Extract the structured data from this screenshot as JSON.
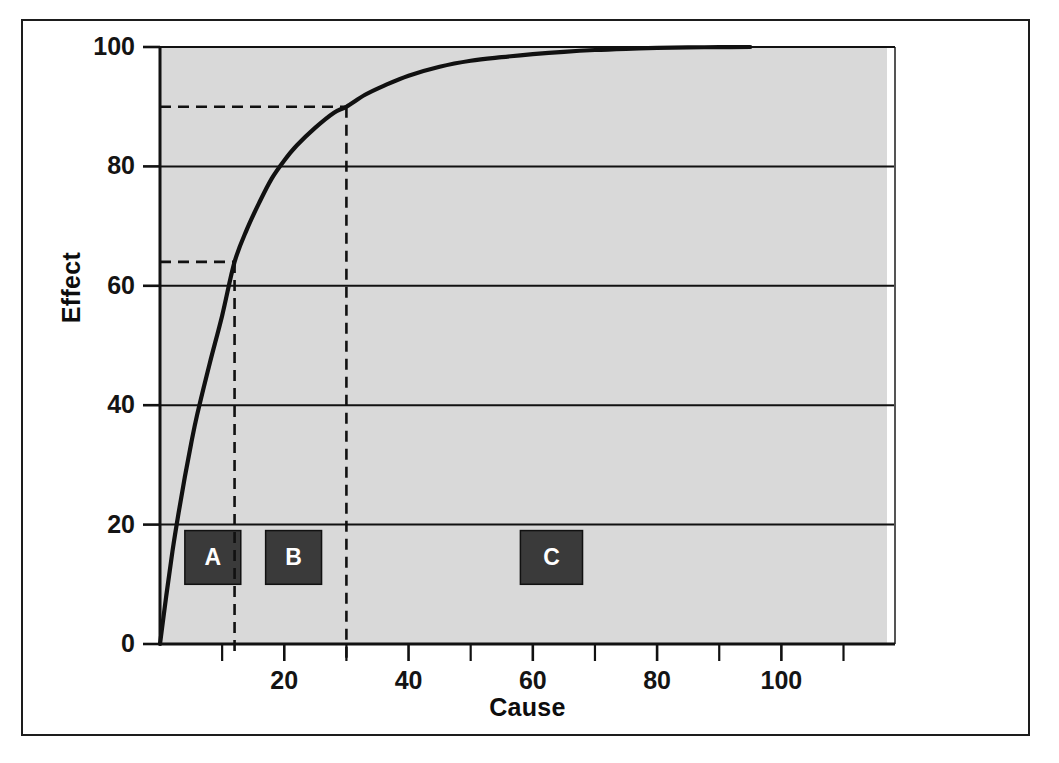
{
  "figure": {
    "caption_fragment": "",
    "background_color": "#ffffff",
    "frame_color": "#1d1d1d"
  },
  "chart_data": {
    "type": "line",
    "title": "",
    "subtitle": "",
    "xlabel": "Cause",
    "ylabel": "Effect",
    "xlim": [
      0,
      117
    ],
    "ylim": [
      0,
      100
    ],
    "grid": true,
    "grid_axis": "y",
    "legend": "none",
    "plot_background_color": "#d9d9d9",
    "curve_color": "#111111",
    "x_ticks": [
      20,
      40,
      60,
      80,
      100
    ],
    "x_tick_labels": [
      "20",
      "40",
      "60",
      "80",
      "100"
    ],
    "y_ticks": [
      0,
      20,
      40,
      60,
      80,
      100
    ],
    "y_tick_labels": [
      "0",
      "20",
      "40",
      "60",
      "80",
      "100"
    ],
    "series": [
      {
        "name": "Cumulative effect",
        "x": [
          0,
          1,
          2,
          3,
          4,
          5,
          6,
          8,
          10,
          12,
          14,
          16,
          18,
          20,
          22,
          25,
          28,
          30,
          33,
          36,
          40,
          45,
          50,
          55,
          60,
          65,
          70,
          75,
          80,
          85,
          90,
          95
        ],
        "y": [
          0,
          8,
          15.5,
          22,
          28,
          33.5,
          38.5,
          47,
          55,
          64,
          69.5,
          74,
          78,
          81,
          83.5,
          86.5,
          89,
          90,
          92,
          93.5,
          95.2,
          96.7,
          97.7,
          98.3,
          98.8,
          99.2,
          99.5,
          99.7,
          99.85,
          99.93,
          99.98,
          100
        ]
      }
    ],
    "annotations": [
      {
        "name": "reference-marker-1",
        "type": "dashed-crosshair",
        "x": 12,
        "y": 64,
        "label": ""
      },
      {
        "name": "reference-marker-2",
        "type": "dashed-crosshair",
        "x": 30,
        "y": 90,
        "label": ""
      }
    ],
    "zones": [
      {
        "label": "A",
        "x_start": 4,
        "x_end": 13,
        "y_start": 10,
        "y_end": 19,
        "color": "#3a3a3a",
        "text_color": "#ffffff"
      },
      {
        "label": "B",
        "x_start": 17,
        "x_end": 26,
        "y_start": 10,
        "y_end": 19,
        "color": "#3a3a3a",
        "text_color": "#ffffff"
      },
      {
        "label": "C",
        "x_start": 58,
        "x_end": 68,
        "y_start": 10,
        "y_end": 19,
        "color": "#3a3a3a",
        "text_color": "#ffffff"
      }
    ]
  }
}
